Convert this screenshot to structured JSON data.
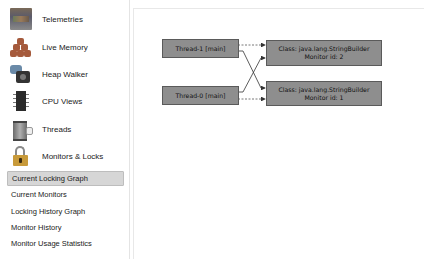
{
  "sidebar": {
    "items": [
      {
        "label": "Telemetries",
        "icon": "telemetry-icon"
      },
      {
        "label": "Live Memory",
        "icon": "live-memory-icon"
      },
      {
        "label": "Heap Walker",
        "icon": "heap-walker-icon"
      },
      {
        "label": "CPU Views",
        "icon": "cpu-icon"
      },
      {
        "label": "Threads",
        "icon": "threads-icon"
      },
      {
        "label": "Monitors & Locks",
        "icon": "lock-icon"
      }
    ],
    "sub_items": [
      {
        "label": "Current Locking Graph",
        "selected": true
      },
      {
        "label": "Current Monitors",
        "selected": false
      },
      {
        "label": "Locking History Graph",
        "selected": false
      },
      {
        "label": "Monitor History",
        "selected": false
      },
      {
        "label": "Monitor Usage Statistics",
        "selected": false
      }
    ]
  },
  "graph": {
    "threads": [
      {
        "label": "Thread-1 [main]"
      },
      {
        "label": "Thread-0 [main]"
      }
    ],
    "monitors": [
      {
        "class_line": "Class: java.lang.StringBuilder",
        "id_line": "Monitor id: 2"
      },
      {
        "class_line": "Class: java.lang.StringBuilder",
        "id_line": "Monitor id: 1"
      }
    ],
    "colors": {
      "node_fill": "#8e8e8e",
      "node_border": "#5a5a5a",
      "edge": "#333333",
      "selection": "#d6d6d6"
    }
  }
}
